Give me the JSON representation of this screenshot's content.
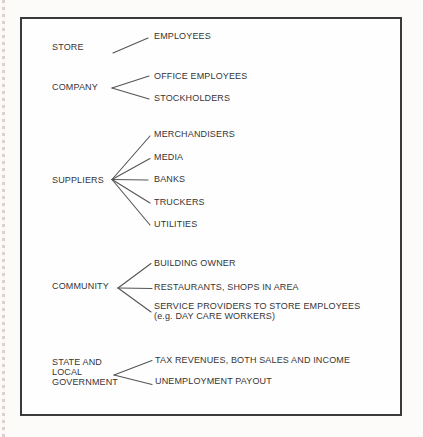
{
  "diagram": {
    "description": "Stakeholder tree diagram: categories affected by a store, each branching to constituent parties",
    "colors": {
      "text": "#353535",
      "connector_line": "#555555",
      "box_border": "#3a3a3a",
      "box_background": "#fffefe",
      "page_background": "#fdfbfa"
    },
    "groups": [
      {
        "label": "STORE",
        "items": [
          "EMPLOYEES"
        ]
      },
      {
        "label": "COMPANY",
        "items": [
          "OFFICE EMPLOYEES",
          "STOCKHOLDERS"
        ]
      },
      {
        "label": "SUPPLIERS",
        "items": [
          "MERCHANDISERS",
          "MEDIA",
          "BANKS",
          "TRUCKERS",
          "UTILITIES"
        ]
      },
      {
        "label": "COMMUNITY",
        "items": [
          "BUILDING OWNER",
          "RESTAURANTS, SHOPS IN AREA",
          "SERVICE PROVIDERS TO STORE EMPLOYEES\n(e.g. DAY CARE WORKERS)"
        ]
      },
      {
        "label": "STATE AND\nLOCAL\nGOVERNMENT",
        "items": [
          "TAX REVENUES, BOTH SALES AND INCOME",
          "UNEMPLOYMENT PAYOUT"
        ]
      }
    ]
  }
}
